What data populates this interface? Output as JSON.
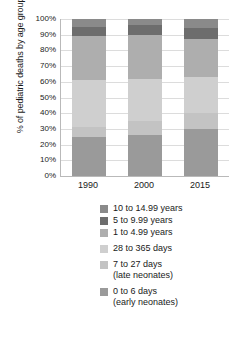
{
  "chart_data": {
    "type": "bar",
    "subtype": "stacked-100-percent",
    "title": "",
    "xlabel": "",
    "ylabel": "% of pediatric deaths by age group",
    "categories": [
      "1990",
      "2000",
      "2015"
    ],
    "ylim": [
      0,
      100
    ],
    "ytick_labels": [
      "0%",
      "10%",
      "20%",
      "30%",
      "40%",
      "50%",
      "60%",
      "70%",
      "80%",
      "90%",
      "100%"
    ],
    "ytick_values": [
      0,
      10,
      20,
      30,
      40,
      50,
      60,
      70,
      80,
      90,
      100
    ],
    "grid": true,
    "legend_position": "below",
    "stack_order_bottom_to_top": [
      "0 to 6 days (early neonates)",
      "7 to 27 days (late neonates)",
      "28 to 365 days",
      "1 to 4.99 years",
      "5 to 9.99 years",
      "10 to 14.99 years"
    ],
    "series": [
      {
        "name": "0 to 6 days (early neonates)",
        "color": "#9a9a9a",
        "values": [
          25,
          26,
          30
        ]
      },
      {
        "name": "7 to 27 days (late neonates)",
        "color": "#c3c3c3",
        "values": [
          6,
          9,
          10
        ]
      },
      {
        "name": "28 to 365 days",
        "color": "#cfcfcf",
        "values": [
          30,
          27,
          23
        ]
      },
      {
        "name": "1 to 4.99 years",
        "color": "#aeaeae",
        "values": [
          28,
          28,
          24
        ]
      },
      {
        "name": "5 to 9.99 years",
        "color": "#6d6d6d",
        "values": [
          6,
          6,
          7
        ]
      },
      {
        "name": "10 to 14.99 years",
        "color": "#8a8a8a",
        "values": [
          5,
          4,
          6
        ]
      }
    ]
  },
  "legend": {
    "entries": [
      {
        "label": "10 to 14.99 years",
        "sub": "",
        "color": "#8a8a8a"
      },
      {
        "label": "5 to 9.99 years",
        "sub": "",
        "color": "#6d6d6d"
      },
      {
        "label": "1 to 4.99 years",
        "sub": "",
        "color": "#aeaeae"
      },
      {
        "label": "28 to 365 days",
        "sub": "",
        "color": "#cfcfcf"
      },
      {
        "label": "7 to 27 days",
        "sub": "(late neonates)",
        "color": "#c3c3c3"
      },
      {
        "label": "0 to 6 days",
        "sub": "(early neonates)",
        "color": "#9a9a9a"
      }
    ]
  },
  "colors": {
    "gridline": "#dcdcdc",
    "axis": "#b9b9b9",
    "text": "#1a1a1a",
    "background": "#ffffff"
  }
}
